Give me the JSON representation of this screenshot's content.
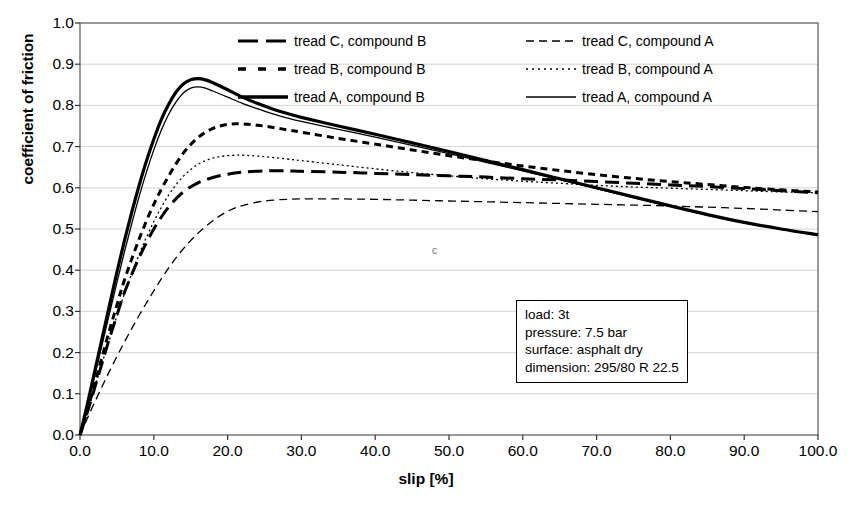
{
  "chart_data": {
    "type": "line",
    "title": "",
    "xlabel": "slip [%]",
    "ylabel": "coefficient of friction",
    "xlim": [
      0,
      100
    ],
    "ylim": [
      0,
      1.0
    ],
    "xticks": [
      "0.0",
      "10.0",
      "20.0",
      "30.0",
      "40.0",
      "50.0",
      "60.0",
      "70.0",
      "80.0",
      "90.0",
      "100.0"
    ],
    "yticks": [
      "0.0",
      "0.1",
      "0.2",
      "0.3",
      "0.4",
      "0.5",
      "0.6",
      "0.7",
      "0.8",
      "0.9",
      "1.0"
    ],
    "grid": true,
    "legend_position": "top-center",
    "annotation_marks": [
      {
        "text": "c",
        "x": 43,
        "y": 0.455
      }
    ],
    "series": [
      {
        "name": "tread C, compound B",
        "style": "thick-long-dash",
        "linewidth": 3.0,
        "dash": "14,7",
        "color": "#000000",
        "x": [
          0,
          1,
          2,
          3,
          4,
          5,
          6,
          8,
          10,
          12,
          14,
          16,
          18,
          20,
          22,
          25,
          28,
          30,
          35,
          40,
          45,
          50,
          55,
          60,
          65,
          70,
          75,
          80,
          85,
          90,
          95,
          100
        ],
        "y": [
          0.0,
          0.055,
          0.115,
          0.175,
          0.235,
          0.29,
          0.345,
          0.43,
          0.5,
          0.553,
          0.59,
          0.612,
          0.625,
          0.633,
          0.638,
          0.641,
          0.641,
          0.64,
          0.638,
          0.635,
          0.632,
          0.629,
          0.626,
          0.622,
          0.619,
          0.615,
          0.611,
          0.607,
          0.603,
          0.598,
          0.593,
          0.588
        ]
      },
      {
        "name": "tread B, compound B",
        "style": "thick-short-dash",
        "linewidth": 3.0,
        "dash": "7,5",
        "color": "#000000",
        "x": [
          0,
          1,
          2,
          3,
          4,
          5,
          6,
          8,
          10,
          12,
          14,
          16,
          18,
          20,
          22,
          24,
          26,
          28,
          30,
          35,
          40,
          45,
          50,
          55,
          60,
          65,
          70,
          75,
          80,
          85,
          90,
          95,
          100
        ],
        "y": [
          0.0,
          0.06,
          0.125,
          0.19,
          0.255,
          0.315,
          0.375,
          0.475,
          0.56,
          0.628,
          0.684,
          0.722,
          0.744,
          0.754,
          0.755,
          0.752,
          0.747,
          0.741,
          0.735,
          0.72,
          0.706,
          0.692,
          0.678,
          0.665,
          0.653,
          0.642,
          0.632,
          0.623,
          0.615,
          0.608,
          0.601,
          0.595,
          0.59
        ]
      },
      {
        "name": "tread A, compound B",
        "style": "thick-solid",
        "linewidth": 3.2,
        "dash": "",
        "color": "#000000",
        "x": [
          0,
          1,
          2,
          3,
          4,
          5,
          6,
          7,
          8,
          9,
          10,
          11,
          12,
          13,
          14,
          15,
          16,
          17,
          18,
          20,
          22,
          24,
          26,
          28,
          30,
          35,
          40,
          45,
          50,
          55,
          60,
          65,
          70,
          75,
          80,
          85,
          90,
          95,
          100
        ],
        "y": [
          0.0,
          0.075,
          0.155,
          0.235,
          0.315,
          0.395,
          0.47,
          0.54,
          0.605,
          0.665,
          0.718,
          0.765,
          0.802,
          0.832,
          0.852,
          0.862,
          0.865,
          0.862,
          0.855,
          0.838,
          0.82,
          0.805,
          0.792,
          0.781,
          0.771,
          0.75,
          0.73,
          0.709,
          0.688,
          0.666,
          0.644,
          0.622,
          0.6,
          0.578,
          0.556,
          0.535,
          0.516,
          0.5,
          0.486
        ]
      },
      {
        "name": "tread C, compound A",
        "style": "thin-dash",
        "linewidth": 1.3,
        "dash": "8,5",
        "color": "#000000",
        "x": [
          0,
          2,
          4,
          6,
          8,
          10,
          12,
          14,
          16,
          18,
          20,
          22,
          25,
          28,
          30,
          35,
          40,
          45,
          50,
          55,
          60,
          65,
          70,
          75,
          80,
          85,
          90,
          95,
          100
        ],
        "y": [
          0.0,
          0.08,
          0.155,
          0.225,
          0.29,
          0.35,
          0.405,
          0.452,
          0.49,
          0.52,
          0.543,
          0.557,
          0.568,
          0.572,
          0.573,
          0.573,
          0.572,
          0.57,
          0.568,
          0.566,
          0.564,
          0.562,
          0.56,
          0.558,
          0.556,
          0.553,
          0.55,
          0.546,
          0.542
        ]
      },
      {
        "name": "tread B, compound A",
        "style": "thin-dotted",
        "linewidth": 1.3,
        "dash": "2,3",
        "color": "#000000",
        "x": [
          0,
          1,
          2,
          3,
          4,
          5,
          6,
          8,
          10,
          12,
          14,
          16,
          18,
          20,
          22,
          24,
          26,
          28,
          30,
          35,
          40,
          45,
          50,
          55,
          60,
          65,
          70,
          75,
          80,
          85,
          90,
          95,
          100
        ],
        "y": [
          0.0,
          0.055,
          0.115,
          0.175,
          0.232,
          0.288,
          0.342,
          0.438,
          0.518,
          0.582,
          0.628,
          0.657,
          0.672,
          0.678,
          0.679,
          0.677,
          0.674,
          0.67,
          0.666,
          0.656,
          0.646,
          0.637,
          0.629,
          0.622,
          0.616,
          0.611,
          0.606,
          0.602,
          0.599,
          0.596,
          0.593,
          0.59,
          0.588
        ]
      },
      {
        "name": "tread A, compound A",
        "style": "thin-solid",
        "linewidth": 1.3,
        "dash": "",
        "color": "#000000",
        "x": [
          0,
          1,
          2,
          3,
          4,
          5,
          6,
          7,
          8,
          9,
          10,
          11,
          12,
          13,
          14,
          15,
          16,
          17,
          18,
          20,
          22,
          24,
          26,
          28,
          30,
          35,
          40,
          45,
          50,
          55,
          60,
          65,
          70,
          75,
          80,
          85,
          90,
          95,
          100
        ],
        "y": [
          0.0,
          0.07,
          0.145,
          0.22,
          0.295,
          0.37,
          0.443,
          0.512,
          0.578,
          0.638,
          0.692,
          0.739,
          0.778,
          0.808,
          0.83,
          0.842,
          0.845,
          0.842,
          0.835,
          0.82,
          0.805,
          0.792,
          0.78,
          0.77,
          0.761,
          0.742,
          0.723,
          0.703,
          0.683,
          0.662,
          0.641,
          0.62,
          0.598,
          0.576,
          0.555,
          0.534,
          0.515,
          0.499,
          0.485
        ]
      }
    ]
  },
  "legend": {
    "items": [
      {
        "label": "tread C, compound B",
        "swatch": "thick-long-dash"
      },
      {
        "label": "tread C, compound A",
        "swatch": "thin-dash"
      },
      {
        "label": "tread B, compound B",
        "swatch": "thick-short-dash"
      },
      {
        "label": "tread B, compound A",
        "swatch": "thin-dotted"
      },
      {
        "label": "tread A, compound B",
        "swatch": "thick-solid"
      },
      {
        "label": "tread A, compound A",
        "swatch": "thin-solid"
      }
    ]
  },
  "info_box": {
    "lines": [
      "load: 3t",
      "pressure: 7.5 bar",
      "surface: asphalt dry",
      "dimension: 295/80 R 22.5"
    ]
  },
  "marks": {
    "stray_c": "c"
  }
}
